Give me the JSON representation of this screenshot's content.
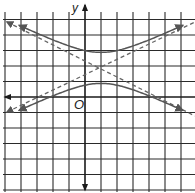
{
  "graph": {
    "type": "hyperbola",
    "labels": {
      "y_axis": "y",
      "origin": "O"
    },
    "equation_form": "(y-k)^2/a^2 - (x-h)^2/b^2 = 1",
    "center": [
      1,
      2
    ],
    "vertices": [
      [
        1,
        3
      ],
      [
        1,
        1
      ]
    ],
    "a": 1,
    "b": 2,
    "asymptote_slopes": [
      0.5,
      -0.5
    ],
    "grid": {
      "x_range": [
        -5,
        6
      ],
      "y_range": [
        -6,
        5
      ],
      "spacing": 1,
      "show": true
    },
    "colors": {
      "grid": "#2a2a2a",
      "axis": "#1a1a1a",
      "curve": "#555555",
      "asymptote": "#666666",
      "background": "#ffffff"
    }
  }
}
